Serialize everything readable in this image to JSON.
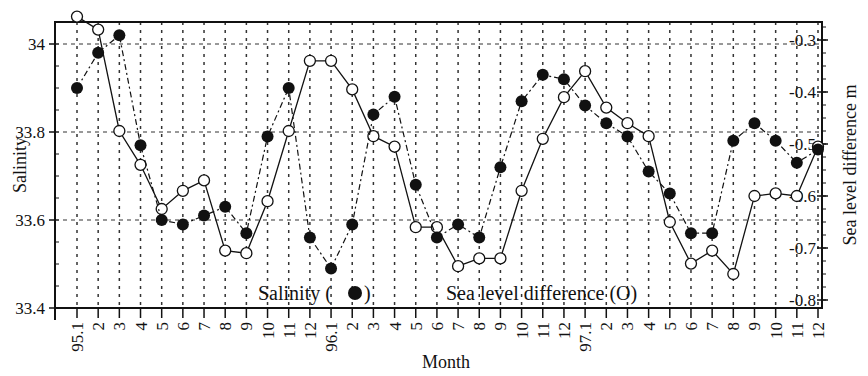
{
  "chart_data": {
    "type": "line",
    "title": "",
    "xlabel": "Month",
    "ylabel": "Salinity",
    "y2label": "Sea level difference  m",
    "ylim": [
      33.4,
      34.05
    ],
    "y2lim": [
      -0.82,
      -0.25
    ],
    "yticks": [
      "33.4",
      "33.6",
      "33.8",
      "34"
    ],
    "y2ticks": [
      "-0.3",
      "-0.4",
      "-0.5",
      "-0.6",
      "-0.7",
      "-0.8"
    ],
    "grid": true,
    "legend": [
      {
        "label": "Salinity (●)",
        "marker": "filled-circle",
        "axis": "left"
      },
      {
        "label": "Sea level difference (O)",
        "marker": "open-circle",
        "axis": "right"
      }
    ],
    "categories": [
      "95.1",
      "2",
      "3",
      "4",
      "5",
      "6",
      "7",
      "8",
      "9",
      "10",
      "11",
      "12",
      "96.1",
      "2",
      "3",
      "4",
      "5",
      "6",
      "7",
      "8",
      "9",
      "10",
      "11",
      "12",
      "97.1",
      "2",
      "3",
      "4",
      "5",
      "6",
      "7",
      "8",
      "9",
      "10",
      "11",
      "12"
    ],
    "series": [
      {
        "name": "Salinity",
        "axis": "left",
        "marker": "filled",
        "line": "dashed",
        "values": [
          33.9,
          33.98,
          34.02,
          33.77,
          33.6,
          33.59,
          33.61,
          33.63,
          33.57,
          33.79,
          33.9,
          33.56,
          33.49,
          33.59,
          33.84,
          33.88,
          33.68,
          33.56,
          33.59,
          33.56,
          33.72,
          33.87,
          33.93,
          33.92,
          33.86,
          33.82,
          33.79,
          33.71,
          33.66,
          33.57,
          33.57,
          33.78,
          33.82,
          33.78,
          33.73,
          33.76
        ]
      },
      {
        "name": "Sea level difference",
        "axis": "right",
        "marker": "open",
        "line": "solid",
        "values": [
          -0.255,
          -0.28,
          -0.475,
          -0.54,
          -0.625,
          -0.59,
          -0.57,
          -0.705,
          -0.71,
          -0.61,
          -0.475,
          -0.34,
          -0.34,
          -0.395,
          -0.485,
          -0.505,
          -0.66,
          -0.66,
          -0.735,
          -0.72,
          -0.72,
          -0.59,
          -0.49,
          -0.41,
          -0.36,
          -0.43,
          -0.46,
          -0.485,
          -0.65,
          -0.73,
          -0.705,
          -0.75,
          -0.6,
          -0.595,
          -0.6,
          -0.505
        ]
      }
    ]
  },
  "labels": {
    "xlabel": "Month",
    "ylabel": "Salinity",
    "y2label": "Sea level difference  m",
    "legend_salinity": "Salinity (",
    "legend_salinity_end": ")",
    "legend_sea": "Sea level difference (O)"
  }
}
